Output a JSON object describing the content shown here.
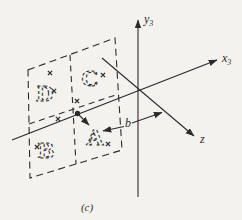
{
  "figure": {
    "caption": "(c)",
    "colors": {
      "ink": "#2b2b2b",
      "paper": "#f4f2ee"
    },
    "axes": {
      "y3": {
        "base": "y",
        "sub": "3"
      },
      "x3": {
        "base": "x",
        "sub": "3"
      },
      "z": {
        "label": "z"
      }
    },
    "dimension_label": "b",
    "panel": {
      "quadrants": [
        {
          "label": "D",
          "x": 45,
          "y": 100.5
        },
        {
          "label": "C",
          "x": 90,
          "y": 85.5
        },
        {
          "label": "B",
          "x": 46,
          "y": 157.5
        },
        {
          "label": "A",
          "x": 95,
          "y": 144.5
        }
      ],
      "image_point_markers": [
        {
          "x": 50,
          "y": 73
        },
        {
          "x": 54,
          "y": 91
        },
        {
          "x": 103,
          "y": 75
        },
        {
          "x": 77,
          "y": 101
        },
        {
          "x": 58,
          "y": 119
        },
        {
          "x": 37,
          "y": 147
        },
        {
          "x": 108,
          "y": 144
        }
      ]
    }
  }
}
